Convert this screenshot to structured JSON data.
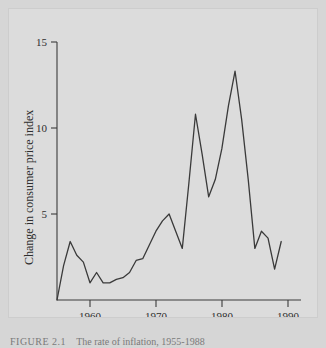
{
  "figure": {
    "caption_label": "FIGURE 2.1",
    "caption_text": "The rate of inflation, 1955-1988",
    "background_color": "#d6d6d6",
    "panel_color": "#dcdcdc",
    "line_color": "#3a3a3a"
  },
  "chart_data": {
    "type": "line",
    "title": "",
    "subtitle": "",
    "xlabel": "",
    "ylabel": "Change in consumer price index",
    "xlim": [
      1954,
      1991
    ],
    "ylim": [
      0,
      15
    ],
    "grid": false,
    "legend": "none",
    "xticks": [
      1960,
      1970,
      1980,
      1990
    ],
    "xtick_labels": [
      "1960",
      "1970",
      "1980",
      "1990"
    ],
    "yticks": [
      5,
      10,
      15
    ],
    "ytick_labels": [
      "5",
      "10",
      "15"
    ],
    "series": [
      {
        "name": "Change in consumer price index",
        "x": [
          1954,
          1955,
          1956,
          1957,
          1958,
          1959,
          1960,
          1961,
          1962,
          1963,
          1964,
          1965,
          1966,
          1967,
          1968,
          1969,
          1970,
          1971,
          1972,
          1973,
          1974,
          1975,
          1976,
          1977,
          1978,
          1979,
          1980,
          1981,
          1982,
          1983,
          1984,
          1985,
          1986,
          1987,
          1988
        ],
        "y": [
          0.0,
          2.0,
          3.4,
          2.6,
          2.2,
          1.0,
          1.6,
          1.0,
          1.0,
          1.2,
          1.3,
          1.6,
          2.3,
          2.4,
          3.2,
          4.0,
          4.6,
          5.0,
          4.0,
          3.0,
          6.8,
          10.8,
          8.5,
          6.0,
          7.0,
          8.8,
          11.3,
          13.3,
          10.5,
          7.0,
          3.0,
          4.0,
          3.6,
          1.8,
          3.4
        ]
      }
    ]
  },
  "axes": {
    "y_axis_name": "y-axis",
    "x_axis_name": "x-axis"
  }
}
